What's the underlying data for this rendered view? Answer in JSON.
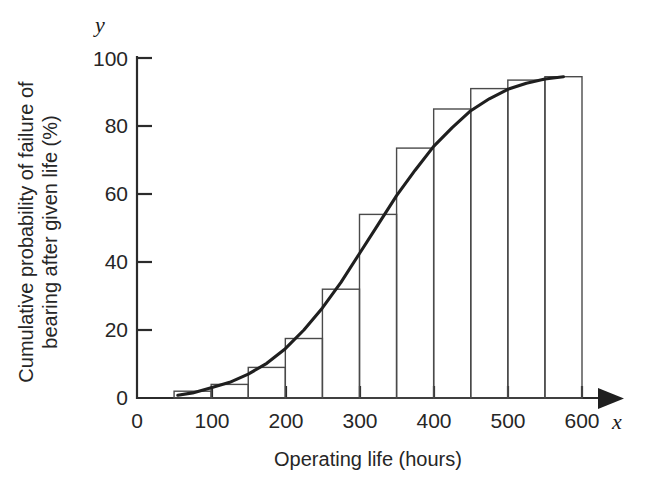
{
  "figure": {
    "background_color": "#ffffff",
    "ink_color": "#1f1f1f",
    "bar_stroke_color": "#4a4a4a"
  },
  "axes": {
    "x_variable_symbol": "x",
    "y_variable_symbol": "y",
    "x_title": "Operating life (hours)",
    "y_title_line1": "Cumulative probability of failure of",
    "y_title_line2": "bearing after given life (%)",
    "x_ticks": [
      "0",
      "100",
      "200",
      "300",
      "400",
      "500",
      "600"
    ],
    "y_ticks": [
      "0",
      "20",
      "40",
      "60",
      "80",
      "100"
    ]
  },
  "chart_data": {
    "type": "bar",
    "title": "",
    "subtitle": "",
    "xlabel": "Operating life (hours)",
    "ylabel": "Cumulative probability of failure of bearing after given life (%)",
    "xlim": [
      0,
      600
    ],
    "ylim": [
      0,
      100
    ],
    "xticks": [
      0,
      100,
      200,
      300,
      400,
      500,
      600
    ],
    "yticks": [
      0,
      20,
      40,
      60,
      80,
      100
    ],
    "grid": false,
    "legend": "none",
    "bin_width": 50,
    "bin_starts": [
      50,
      100,
      150,
      200,
      250,
      300,
      350,
      400,
      450,
      500,
      550
    ],
    "bin_ends": [
      100,
      150,
      200,
      250,
      300,
      350,
      400,
      450,
      500,
      550,
      600
    ],
    "categories": [
      "50-100",
      "100-150",
      "150-200",
      "200-250",
      "250-300",
      "300-350",
      "350-400",
      "400-450",
      "450-500",
      "500-550",
      "550-600"
    ],
    "values": [
      2,
      4,
      9,
      17.5,
      32,
      54,
      73.5,
      85,
      91,
      93.5,
      94.5
    ],
    "series": [
      {
        "name": "Cumulative frequency bars",
        "type": "bar",
        "values": [
          2,
          4,
          9,
          17.5,
          32,
          54,
          73.5,
          85,
          91,
          93.5,
          94.5
        ]
      },
      {
        "name": "Fitted cumulative curve",
        "type": "line",
        "x": [
          55,
          75,
          100,
          125,
          150,
          175,
          200,
          225,
          250,
          275,
          300,
          325,
          350,
          375,
          400,
          425,
          450,
          475,
          500,
          525,
          550,
          575
        ],
        "y": [
          0.8,
          1.5,
          3.0,
          4.6,
          7.0,
          10.2,
          14.5,
          20.0,
          26.5,
          34.0,
          42.5,
          51.0,
          59.5,
          67.0,
          74.0,
          79.5,
          84.5,
          88.0,
          90.8,
          92.6,
          93.8,
          94.5
        ]
      }
    ]
  }
}
